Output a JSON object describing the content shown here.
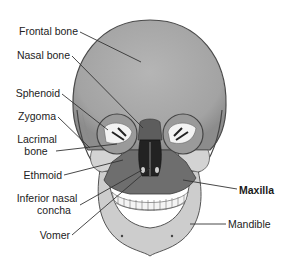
{
  "diagram": {
    "colors": {
      "skull_base": "#a9a9a9",
      "skull_light": "#cfcfcf",
      "skull_dark": "#5a5a5a",
      "maxilla": "#6f6f6f",
      "teeth": "#f2f2f2",
      "leader_line": "#333333",
      "label_text": "#222222"
    },
    "labels": [
      {
        "id": "frontal",
        "text": "Frontal bone",
        "bold": false
      },
      {
        "id": "nasal",
        "text": "Nasal bone",
        "bold": false
      },
      {
        "id": "sphenoid",
        "text": "Sphenoid",
        "bold": false
      },
      {
        "id": "zygoma",
        "text": "Zygoma",
        "bold": false
      },
      {
        "id": "lacrimal",
        "text": "Lacrimal",
        "text2": "bone",
        "bold": false
      },
      {
        "id": "ethmoid",
        "text": "Ethmoid",
        "bold": false
      },
      {
        "id": "inferior_nasal_concha",
        "text": "Inferior nasal",
        "text2": "concha",
        "bold": false
      },
      {
        "id": "vomer",
        "text": "Vomer",
        "bold": false
      },
      {
        "id": "maxilla",
        "text": "Maxilla",
        "bold": true
      },
      {
        "id": "mandible",
        "text": "Mandible",
        "bold": false
      }
    ]
  }
}
